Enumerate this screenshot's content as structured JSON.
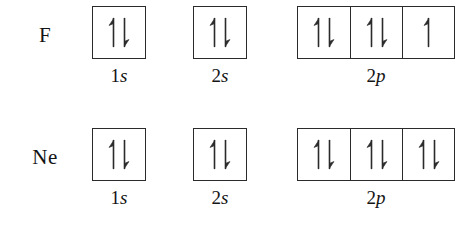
{
  "diagram": {
    "ink_color": "#2b2b2b",
    "background_color": "#ffffff",
    "rows": [
      {
        "element": "F",
        "orbitals": [
          {
            "n": "1",
            "l": "s",
            "label": "1s",
            "cells": [
              {
                "spins": [
                  "up",
                  "down"
                ]
              }
            ]
          },
          {
            "n": "2",
            "l": "s",
            "label": "2s",
            "cells": [
              {
                "spins": [
                  "up",
                  "down"
                ]
              }
            ]
          },
          {
            "n": "2",
            "l": "p",
            "label": "2p",
            "cells": [
              {
                "spins": [
                  "up",
                  "down"
                ]
              },
              {
                "spins": [
                  "up",
                  "down"
                ]
              },
              {
                "spins": [
                  "up"
                ]
              }
            ]
          }
        ]
      },
      {
        "element": "Ne",
        "orbitals": [
          {
            "n": "1",
            "l": "s",
            "label": "1s",
            "cells": [
              {
                "spins": [
                  "up",
                  "down"
                ]
              }
            ]
          },
          {
            "n": "2",
            "l": "s",
            "label": "2s",
            "cells": [
              {
                "spins": [
                  "up",
                  "down"
                ]
              }
            ]
          },
          {
            "n": "2",
            "l": "p",
            "label": "2p",
            "cells": [
              {
                "spins": [
                  "up",
                  "down"
                ]
              },
              {
                "spins": [
                  "up",
                  "down"
                ]
              },
              {
                "spins": [
                  "up",
                  "down"
                ]
              }
            ]
          }
        ]
      }
    ]
  }
}
